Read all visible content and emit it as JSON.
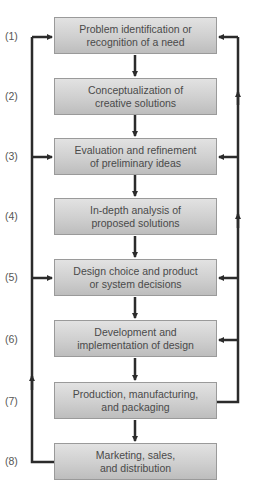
{
  "diagram": {
    "steps": [
      {
        "num": "(1)",
        "line1": "Problem identification or",
        "line2": "recognition of a need"
      },
      {
        "num": "(2)",
        "line1": "Conceptualization of",
        "line2": "creative solutions"
      },
      {
        "num": "(3)",
        "line1": "Evaluation and refinement",
        "line2": "of preliminary ideas"
      },
      {
        "num": "(4)",
        "line1": "In-depth analysis of",
        "line2": "proposed solutions"
      },
      {
        "num": "(5)",
        "line1": "Design choice and product",
        "line2": "or system decisions"
      },
      {
        "num": "(6)",
        "line1": "Development and",
        "line2": "implementation of design"
      },
      {
        "num": "(7)",
        "line1": "Production, manufacturing,",
        "line2": "and packaging"
      },
      {
        "num": "(8)",
        "line1": "Marketing, sales,",
        "line2": "and distribution"
      }
    ],
    "colors": {
      "arrow": "#2b2b2b",
      "box_border": "#9a9a9a",
      "box_fill_top": "#e2e2e2",
      "box_fill_bottom": "#bdbdbd",
      "text": "#4a4a4a"
    }
  }
}
